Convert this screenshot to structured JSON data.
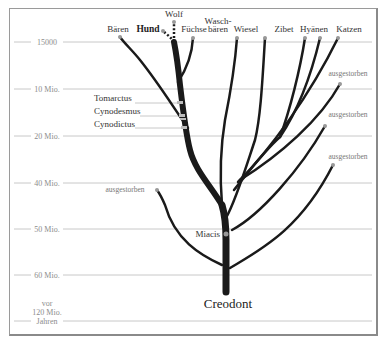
{
  "diagram": {
    "root_label": "Creodont",
    "node_label": "Miacis",
    "time_axis": [
      {
        "label": "15000",
        "y": 42
      },
      {
        "label": "10 Mio.",
        "y": 89
      },
      {
        "label": "20 Mio.",
        "y": 136
      },
      {
        "label": "40 Mio.",
        "y": 183
      },
      {
        "label": "50 Mio.",
        "y": 229
      },
      {
        "label": "60 Mio.",
        "y": 275
      },
      {
        "label_lines": [
          "vor",
          "120 Mio.",
          "Jahren"
        ],
        "y": 321
      }
    ],
    "leaves": {
      "baeren": "Bären",
      "hund": "Hund",
      "wolf": "Wolf",
      "fuechse": "Füchse",
      "waschbaeren_1": "Wasch-",
      "waschbaeren_2": "bären",
      "wiesel": "Wiesel",
      "zibet": "Zibet",
      "hyaenen": "Hyänen",
      "katzen": "Katzen"
    },
    "fossils": {
      "tomarctus": "Tomarctus",
      "cynodesmus": "Cynodesmus",
      "cynodictus": "Cynodictus"
    },
    "extinct": {
      "right_1": "ausgestorben",
      "right_2": "ausgestorben",
      "right_3": "ausgestorben",
      "left_1": "ausgestorben"
    },
    "colors": {
      "branch": "#1a1a1a",
      "grid": "#c8c8c8",
      "tick_text": "#8c8c8c",
      "node": "#999999"
    }
  }
}
